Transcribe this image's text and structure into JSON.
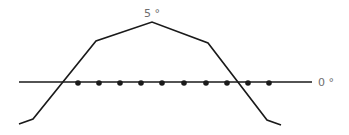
{
  "labels": {
    "peak": "5 °",
    "baseline": "0 °"
  },
  "colors": {
    "line": "#1a1a1a",
    "label": "#6e6e6e",
    "background": "#ffffff"
  },
  "diagram": {
    "baseline": {
      "x1": 19,
      "x2": 312,
      "y": 82
    },
    "profile_points": [
      [
        19,
        124
      ],
      [
        33,
        119
      ],
      [
        96,
        41
      ],
      [
        152,
        22
      ],
      [
        208,
        43
      ],
      [
        267,
        120
      ],
      [
        281,
        125
      ]
    ],
    "dots": [
      {
        "x": 78,
        "y": 83
      },
      {
        "x": 99,
        "y": 83
      },
      {
        "x": 120,
        "y": 83
      },
      {
        "x": 141,
        "y": 83
      },
      {
        "x": 162,
        "y": 83
      },
      {
        "x": 184,
        "y": 83
      },
      {
        "x": 206,
        "y": 83
      },
      {
        "x": 227,
        "y": 83
      },
      {
        "x": 248,
        "y": 83
      },
      {
        "x": 269,
        "y": 83
      }
    ]
  }
}
